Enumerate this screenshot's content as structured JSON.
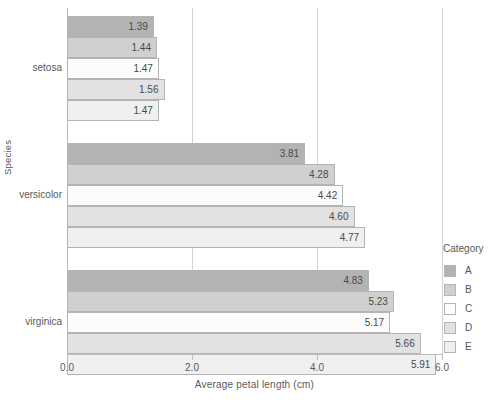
{
  "chart_data": {
    "type": "bar",
    "orientation": "horizontal",
    "title": "",
    "xlabel": "Average petal length (cm)",
    "ylabel": "Species",
    "xlim": [
      0.0,
      6.0
    ],
    "xticks": [
      "0.0",
      "2.0",
      "4.0",
      "6.0"
    ],
    "xtick_values": [
      0.0,
      2.0,
      4.0,
      6.0
    ],
    "gridlines": [
      2.0,
      4.0,
      6.0
    ],
    "grid": true,
    "legend_title": "Category",
    "legend_position": "right",
    "categories": [
      "setosa",
      "versicolor",
      "virginica"
    ],
    "series": [
      {
        "name": "A",
        "color": "#b3b3b3",
        "values": [
          1.39,
          3.81,
          4.83
        ]
      },
      {
        "name": "B",
        "color": "#d0d0d0",
        "values": [
          1.44,
          4.28,
          5.23
        ]
      },
      {
        "name": "C",
        "color": "#fcfcfc",
        "values": [
          1.47,
          4.42,
          5.17
        ]
      },
      {
        "name": "D",
        "color": "#e2e2e2",
        "values": [
          1.56,
          4.6,
          5.66
        ]
      },
      {
        "name": "E",
        "color": "#f0f0f0",
        "values": [
          1.47,
          4.77,
          5.91
        ]
      }
    ],
    "bars": [
      {
        "group": "setosa",
        "series": "A",
        "value": 1.39,
        "label": "1.39"
      },
      {
        "group": "setosa",
        "series": "B",
        "value": 1.44,
        "label": "1.44"
      },
      {
        "group": "setosa",
        "series": "C",
        "value": 1.47,
        "label": "1.47"
      },
      {
        "group": "setosa",
        "series": "D",
        "value": 1.56,
        "label": "1.56"
      },
      {
        "group": "setosa",
        "series": "E",
        "value": 1.47,
        "label": "1.47"
      },
      {
        "group": "versicolor",
        "series": "A",
        "value": 3.81,
        "label": "3.81"
      },
      {
        "group": "versicolor",
        "series": "B",
        "value": 4.28,
        "label": "4.28"
      },
      {
        "group": "versicolor",
        "series": "C",
        "value": 4.42,
        "label": "4.42"
      },
      {
        "group": "versicolor",
        "series": "D",
        "value": 4.6,
        "label": "4.60"
      },
      {
        "group": "versicolor",
        "series": "E",
        "value": 4.77,
        "label": "4.77"
      },
      {
        "group": "virginica",
        "series": "A",
        "value": 4.83,
        "label": "4.83"
      },
      {
        "group": "virginica",
        "series": "B",
        "value": 5.23,
        "label": "5.23"
      },
      {
        "group": "virginica",
        "series": "C",
        "value": 5.17,
        "label": "5.17"
      },
      {
        "group": "virginica",
        "series": "D",
        "value": 5.66,
        "label": "5.66"
      },
      {
        "group": "virginica",
        "series": "E",
        "value": 5.91,
        "label": "5.91"
      }
    ]
  },
  "style": {
    "grid_color": "#d3d3d3",
    "axis_color": "#bdbdbd",
    "bar_edge_color": "#b4b4b4",
    "text_color": "#5a5a5a",
    "background": "#ffffff"
  }
}
